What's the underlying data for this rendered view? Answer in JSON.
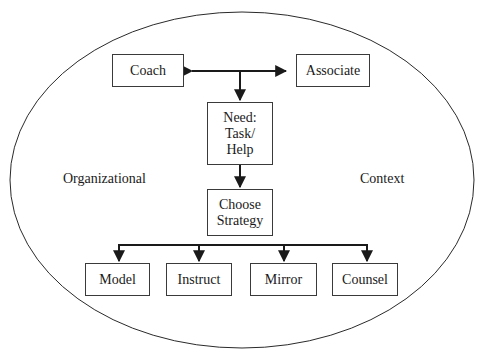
{
  "diagram": {
    "context_left": "Organizational",
    "context_right": "Context",
    "nodes": {
      "coach": "Coach",
      "associate": "Associate",
      "need": "Need:\nTask/\nHelp",
      "choose_strategy": "Choose\nStrategy",
      "strategies": [
        "Model",
        "Instruct",
        "Mirror",
        "Counsel"
      ]
    },
    "edges": [
      {
        "from": "coach",
        "to": "associate",
        "type": "bidirectional"
      },
      {
        "from": "coach-associate",
        "to": "need",
        "type": "arrow"
      },
      {
        "from": "need",
        "to": "choose_strategy",
        "type": "arrow"
      },
      {
        "from": "choose_strategy",
        "to": "Model",
        "type": "arrow"
      },
      {
        "from": "choose_strategy",
        "to": "Instruct",
        "type": "arrow"
      },
      {
        "from": "choose_strategy",
        "to": "Mirror",
        "type": "arrow"
      },
      {
        "from": "choose_strategy",
        "to": "Counsel",
        "type": "arrow"
      }
    ],
    "colors": {
      "line": "#1a1a1a",
      "background": "#ffffff"
    }
  }
}
